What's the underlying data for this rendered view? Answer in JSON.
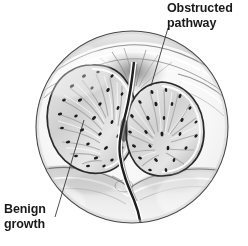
{
  "figure": {
    "type": "medical-illustration",
    "style": "grayscale pen-and-ink shaded drawing in circular vignette",
    "background_color": "#ffffff",
    "vignette": {
      "shape": "circle",
      "center_x": 132,
      "center_y": 127,
      "radius": 96,
      "stroke_color": "#4a4a4a",
      "stroke_width": 1.1
    },
    "ink_color": "#1a1a1a",
    "tissue_light": "#f2f2f2",
    "tissue_mid": "#b8b8b8",
    "tissue_dark": "#6e6e6e"
  },
  "labels": [
    {
      "id": "obstructed-pathway",
      "text": "Obstructed\npathway",
      "color": "#1a1a1a",
      "x": 167,
      "y": 1,
      "leader": {
        "from_x": 168,
        "from_y": 28,
        "to_x": 151,
        "to_y": 86,
        "stroke_color": "#3a3a3a",
        "stroke_width": 0.9
      }
    },
    {
      "id": "benign-growth",
      "text": "Benign\ngrowth",
      "color": "#1a1a1a",
      "x": 4,
      "y": 202,
      "leader": {
        "from_x": 84,
        "from_y": 120,
        "to_x": 55,
        "to_y": 217,
        "stroke_color": "#3a3a3a",
        "stroke_width": 0.9
      }
    }
  ],
  "anatomy": {
    "left_lobe": {
      "name": "left prostatic lobe (benign growth)",
      "center_x": 92,
      "center_y": 117,
      "rx": 44,
      "ry": 52
    },
    "right_lobe": {
      "name": "right prostatic lobe (benign growth)",
      "center_x": 165,
      "center_y": 129,
      "rx": 40,
      "ry": 47
    },
    "urethra": {
      "name": "compressed urethral pathway",
      "description": "narrow dark channel running from bladder neck down between the two lobes"
    },
    "bladder_neck": {
      "name": "bladder neck tissue folds",
      "description": "converging folds with white highlight bands across the upper part of the circle"
    }
  }
}
